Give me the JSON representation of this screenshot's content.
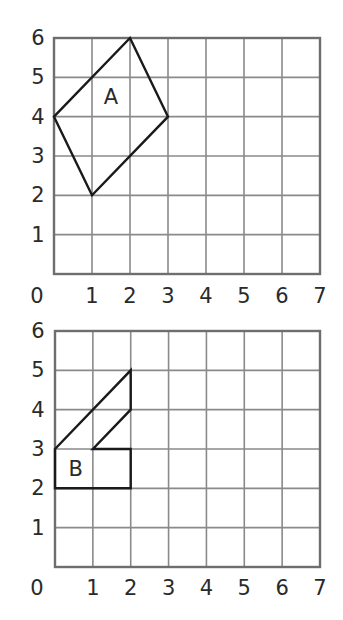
{
  "chart_data": [
    {
      "type": "diagram",
      "title": "",
      "grid": {
        "x_range": [
          0,
          7
        ],
        "y_range": [
          0,
          6
        ],
        "gridlines": true
      },
      "x_tick_labels": [
        "0",
        "1",
        "2",
        "3",
        "4",
        "5",
        "6",
        "7"
      ],
      "y_tick_labels": [
        "1",
        "2",
        "3",
        "4",
        "5",
        "6"
      ],
      "shape": {
        "label": "A",
        "vertices": [
          [
            0,
            4
          ],
          [
            2,
            6
          ],
          [
            3,
            4
          ],
          [
            1,
            2
          ]
        ],
        "label_position": [
          1.5,
          4.5
        ]
      }
    },
    {
      "type": "diagram",
      "title": "",
      "grid": {
        "x_range": [
          0,
          7
        ],
        "y_range": [
          0,
          6
        ],
        "gridlines": true
      },
      "x_tick_labels": [
        "0",
        "1",
        "2",
        "3",
        "4",
        "5",
        "6",
        "7"
      ],
      "y_tick_labels": [
        "1",
        "2",
        "3",
        "4",
        "5",
        "6"
      ],
      "shape": {
        "label": "B",
        "vertices": [
          [
            0,
            3
          ],
          [
            2,
            5
          ],
          [
            2,
            4
          ],
          [
            1,
            3
          ],
          [
            2,
            3
          ],
          [
            2,
            2
          ],
          [
            0,
            2
          ]
        ],
        "label_position": [
          0.55,
          2.5
        ]
      }
    }
  ],
  "grids": [
    {
      "name": "top",
      "label": "A",
      "origin_label": "0"
    },
    {
      "name": "bottom",
      "label": "B",
      "origin_label": "0"
    }
  ]
}
